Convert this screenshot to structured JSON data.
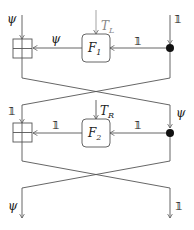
{
  "diagram": {
    "inputs": {
      "left": "ψ",
      "right": "𝟙"
    },
    "outputs": {
      "left": "ψ",
      "right": "𝟙"
    },
    "round1": {
      "function": "F",
      "function_sub": "1",
      "key": "T",
      "key_sub": "L",
      "left_wire_label": "ψ",
      "right_wire_label": "𝟙"
    },
    "round2": {
      "function": "F",
      "function_sub": "2",
      "key": "T",
      "key_sub": "R",
      "left_input_label": "𝟙",
      "right_input_label": "ψ",
      "left_wire_label": "𝟙",
      "right_wire_label": "𝟙"
    },
    "colors": {
      "line": "#555555",
      "key": "#999999",
      "dot": "#111111"
    }
  }
}
